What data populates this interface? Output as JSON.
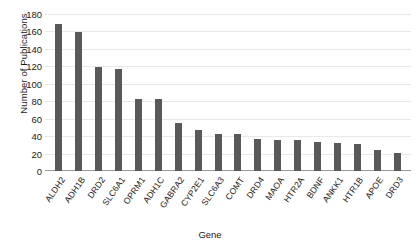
{
  "chart_data": {
    "type": "bar",
    "title": "",
    "xlabel": "Gene",
    "ylabel": "Number of Publications",
    "categories": [
      "ALDH2",
      "ADH1B",
      "DRD2",
      "SLC6A1",
      "OPRM1",
      "ADH1C",
      "GABRA2",
      "CYP2E1",
      "SLC6A3",
      "COMT",
      "DRD4",
      "MAOA",
      "HTR2A",
      "BDNF",
      "ANKK1",
      "HTR1B",
      "APOE",
      "DRD3"
    ],
    "values": [
      169,
      159,
      119,
      117,
      83,
      82,
      55,
      47,
      43,
      42,
      37,
      36,
      35,
      33,
      32,
      31,
      24,
      21
    ],
    "ylim": [
      0,
      180
    ],
    "yticks": [
      0,
      20,
      40,
      60,
      80,
      100,
      120,
      140,
      160,
      180
    ],
    "ytick_labels": [
      "0",
      "20",
      "40",
      "60",
      "80",
      "100",
      "120",
      "140",
      "160",
      "180"
    ],
    "grid": true,
    "legend": "none",
    "bar_color": "#595959",
    "grid_color": "#e8e8e8",
    "axis_color": "#9a9a9a",
    "background": "#ffffff",
    "text_color": "#1a1a1a"
  }
}
